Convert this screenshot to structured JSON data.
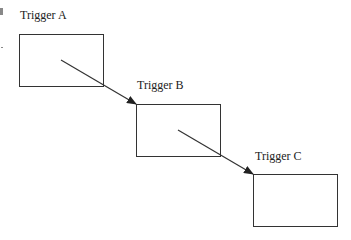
{
  "diagram": {
    "nodes": [
      {
        "id": "A",
        "label": "Trigger A"
      },
      {
        "id": "B",
        "label": "Trigger B"
      },
      {
        "id": "C",
        "label": "Trigger C"
      }
    ],
    "edges": [
      {
        "from": "A",
        "to": "B"
      },
      {
        "from": "B",
        "to": "C"
      }
    ],
    "colors": {
      "stroke": "#333333",
      "background": "#ffffff"
    }
  }
}
